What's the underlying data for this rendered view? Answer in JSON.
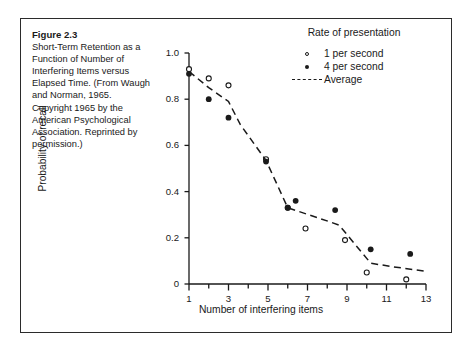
{
  "figure": {
    "title": "Figure 2.3",
    "caption": "Short-Term Retention as a Function of Number of Interfering Items versus Elapsed Time. (From Waugh and Norman, 1965. Copyright 1965 by the American Psychological Association. Reprinted by permission.)"
  },
  "legend": {
    "title": "Rate of presentation",
    "entries": [
      {
        "label": "1 per second",
        "key": "open-circle-marker"
      },
      {
        "label": "4 per second",
        "key": "filled-circle-marker"
      },
      {
        "label": "Average",
        "key": "dashed-line-marker"
      }
    ]
  },
  "chart_data": {
    "type": "scatter",
    "title": "",
    "xlabel": "Number of interfering items",
    "ylabel": "Probability of recall",
    "xlim": [
      1,
      13
    ],
    "ylim": [
      0,
      1.0
    ],
    "grid": false,
    "legend_position": "top-right",
    "xticks": [
      1,
      2,
      3,
      4,
      5,
      6,
      7,
      8,
      9,
      10,
      11,
      12,
      13
    ],
    "xticklabels": [
      "1",
      "",
      "3",
      "",
      "5",
      "",
      "7",
      "",
      "9",
      "",
      "11",
      "",
      "13"
    ],
    "yticks": [
      0,
      0.2,
      0.4,
      0.6,
      0.8,
      1.0
    ],
    "yticklabels": [
      "0",
      "0.2",
      "0.4",
      "0.6",
      "0.8",
      "1.0"
    ],
    "series": [
      {
        "name": "1 per second",
        "marker": "open-circle",
        "points": [
          [
            1.0,
            0.93
          ],
          [
            2.0,
            0.89
          ],
          [
            3.0,
            0.86
          ],
          [
            4.9,
            0.54
          ],
          [
            6.0,
            0.33
          ],
          [
            6.9,
            0.24
          ],
          [
            8.9,
            0.19
          ],
          [
            10.0,
            0.05
          ],
          [
            12.0,
            0.02
          ]
        ]
      },
      {
        "name": "4 per second",
        "marker": "filled-circle",
        "points": [
          [
            1.0,
            0.91
          ],
          [
            2.0,
            0.8
          ],
          [
            3.0,
            0.72
          ],
          [
            4.9,
            0.53
          ],
          [
            6.0,
            0.33
          ],
          [
            6.4,
            0.36
          ],
          [
            8.4,
            0.32
          ],
          [
            10.2,
            0.15
          ],
          [
            12.2,
            0.13
          ]
        ]
      },
      {
        "name": "Average",
        "marker": "dashed-line",
        "points": [
          [
            1.0,
            0.92
          ],
          [
            2.0,
            0.85
          ],
          [
            3.0,
            0.79
          ],
          [
            3.6,
            0.69
          ],
          [
            4.9,
            0.535
          ],
          [
            6.0,
            0.33
          ],
          [
            8.1,
            0.27
          ],
          [
            8.6,
            0.255
          ],
          [
            10.2,
            0.09
          ],
          [
            11.3,
            0.075
          ],
          [
            13.0,
            0.055
          ]
        ]
      }
    ]
  }
}
